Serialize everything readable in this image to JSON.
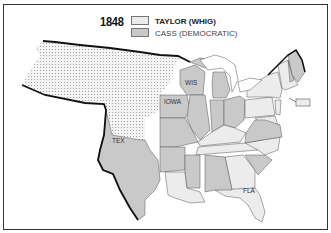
{
  "map": {
    "title_year": "1848",
    "legend": [
      {
        "label": "TAYLOR (WHIG)",
        "color": "#ececec",
        "key": "whig"
      },
      {
        "label": "CASS (DEMOCRATIC)",
        "color": "#c9c9c9",
        "key": "democratic"
      }
    ],
    "territory_pattern": "dotted",
    "territory_color": "#f2f2f2",
    "border_color": "#111111",
    "state_labels": [
      {
        "text": "WIS",
        "x": 186,
        "y": 85
      },
      {
        "text": "IOWA",
        "x": 166,
        "y": 104
      },
      {
        "text": "TEX",
        "x": 114,
        "y": 143
      },
      {
        "text": "FLA",
        "x": 243,
        "y": 193
      }
    ]
  }
}
